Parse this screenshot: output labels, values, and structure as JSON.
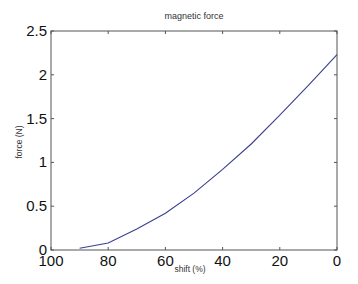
{
  "chart_data": {
    "type": "line",
    "title": "magnetic force",
    "xlabel": "shift (%)",
    "ylabel": "force (N)",
    "xlim": [
      100,
      0
    ],
    "ylim": [
      0,
      2.5
    ],
    "x_reversed": true,
    "grid": false,
    "legend": null,
    "xticks": [
      "100",
      "80",
      "60",
      "40",
      "20",
      "0"
    ],
    "yticks": [
      "0",
      "0.5",
      "1",
      "1.5",
      "2",
      "2.5"
    ],
    "series": [
      {
        "name": "magnetic force",
        "color": "#3a3f8f",
        "x": [
          90,
          80,
          70,
          60,
          50,
          40,
          30,
          20,
          10,
          0
        ],
        "y": [
          0.02,
          0.08,
          0.24,
          0.42,
          0.65,
          0.92,
          1.21,
          1.54,
          1.88,
          2.23
        ]
      }
    ]
  },
  "colors": {
    "axis": "#555555",
    "line": "#3a3f8f"
  }
}
